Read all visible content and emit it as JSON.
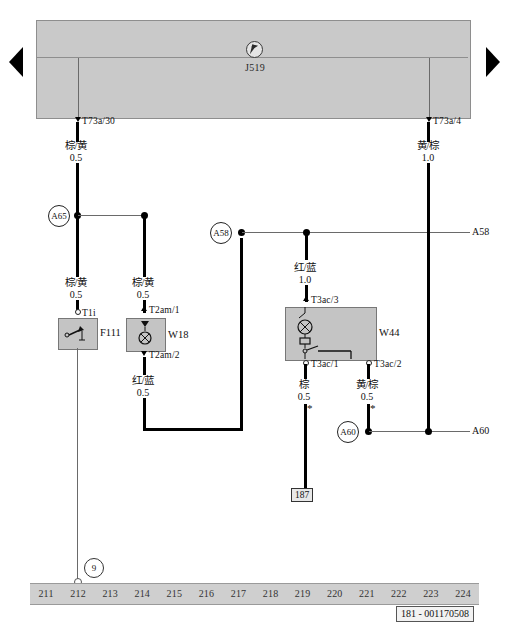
{
  "diagram": {
    "doc_id": "181 - 001170508",
    "module": {
      "name": "J519",
      "cursor_icon": "pointer-cursor-icon"
    },
    "connectors": {
      "t73a_30": "T73a/30",
      "t73a_4": "T73a/4",
      "t1i": "T1i",
      "t2am_1": "T2am/1",
      "t2am_2": "T2am/2",
      "t3ac_3": "T3ac/3",
      "t3ac_1": "T3ac/1",
      "t3ac_2": "T3ac/2"
    },
    "components": {
      "f111": "F111",
      "w18": "W18",
      "w44": "W44"
    },
    "junctions": {
      "a65": "A65",
      "a58": "A58",
      "a60": "A60",
      "a58_edge": "A58",
      "a60_edge": "A60"
    },
    "node": {
      "number": "9"
    },
    "ground": {
      "label": "187"
    },
    "wires": [
      {
        "id": "w_t73a30",
        "color": "棕/黄",
        "gauge": "0.5"
      },
      {
        "id": "w_t73a4",
        "color": "黄/棕",
        "gauge": "1.0"
      },
      {
        "id": "w_f111",
        "color": "棕/黄",
        "gauge": "0.5"
      },
      {
        "id": "w_w18_top",
        "color": "棕/黄",
        "gauge": "0.5"
      },
      {
        "id": "w_w18_bot",
        "color": "红/蓝",
        "gauge": "0.5"
      },
      {
        "id": "w_w44_top",
        "color": "红/蓝",
        "gauge": "1.0"
      },
      {
        "id": "w_w44_l",
        "color": "棕",
        "gauge": "0.5"
      },
      {
        "id": "w_w44_r",
        "color": "黄/棕",
        "gauge": "0.5"
      }
    ],
    "ruler": [
      "211",
      "212",
      "213",
      "214",
      "215",
      "216",
      "217",
      "218",
      "219",
      "220",
      "221",
      "222",
      "223",
      "224"
    ],
    "markers": {
      "asterisk": "*"
    }
  }
}
